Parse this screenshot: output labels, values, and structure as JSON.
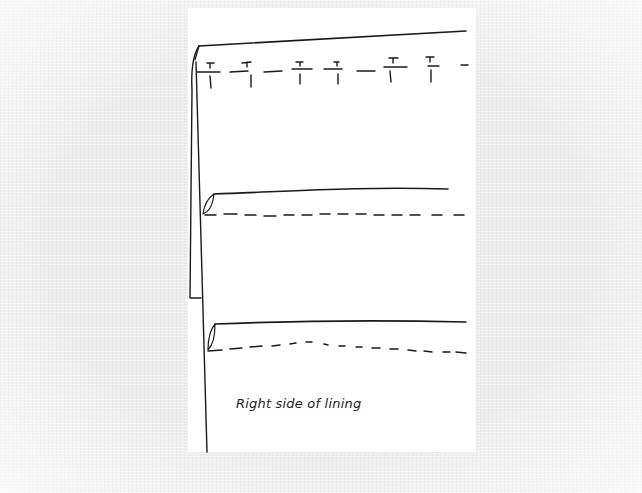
{
  "figure": {
    "caption": "Right side of lining",
    "ink_color": "#1a1a1a",
    "paper_color": "#ffffff",
    "background_color": "#ececec",
    "elements": {
      "top_seam": "solid fold line with tailor's tacks below",
      "tack_count": 7,
      "middle_tuck": "solid fold line with dashed stitching line",
      "lower_tuck": "solid fold line with dashed stitching line",
      "side_panel": "folded lining edge on left"
    }
  }
}
